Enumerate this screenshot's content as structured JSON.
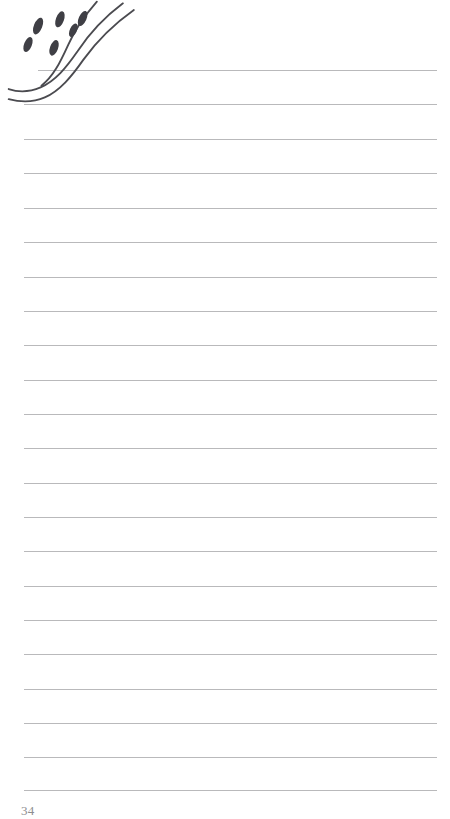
{
  "page": {
    "kind": "lined-notebook-page",
    "width": 450,
    "height": 819,
    "background_color": "#ffffff",
    "page_number": "34"
  },
  "rules": {
    "line_color": "#b9b9bb",
    "line_thickness_px": 1,
    "left_margin_px": 24,
    "right_edge_px": 437,
    "spacing_px": 34.5,
    "count": 22,
    "lines": [
      {
        "y": 70,
        "x1": 38,
        "x2": 437
      },
      {
        "y": 104,
        "x1": 24,
        "x2": 437
      },
      {
        "y": 139,
        "x1": 24,
        "x2": 437
      },
      {
        "y": 173,
        "x1": 24,
        "x2": 437
      },
      {
        "y": 208,
        "x1": 24,
        "x2": 437
      },
      {
        "y": 242,
        "x1": 24,
        "x2": 437
      },
      {
        "y": 277,
        "x1": 24,
        "x2": 437
      },
      {
        "y": 311,
        "x1": 24,
        "x2": 437
      },
      {
        "y": 345,
        "x1": 24,
        "x2": 437
      },
      {
        "y": 380,
        "x1": 24,
        "x2": 437
      },
      {
        "y": 414,
        "x1": 24,
        "x2": 437
      },
      {
        "y": 448,
        "x1": 24,
        "x2": 437
      },
      {
        "y": 483,
        "x1": 24,
        "x2": 437
      },
      {
        "y": 517,
        "x1": 24,
        "x2": 437
      },
      {
        "y": 551,
        "x1": 24,
        "x2": 437
      },
      {
        "y": 586,
        "x1": 24,
        "x2": 437
      },
      {
        "y": 620,
        "x1": 24,
        "x2": 437
      },
      {
        "y": 654,
        "x1": 24,
        "x2": 437
      },
      {
        "y": 689,
        "x1": 24,
        "x2": 437
      },
      {
        "y": 723,
        "x1": 24,
        "x2": 437
      },
      {
        "y": 757,
        "x1": 24,
        "x2": 437
      },
      {
        "y": 790,
        "x1": 24,
        "x2": 437
      }
    ]
  },
  "illustration": {
    "name": "flowing-leaf-sprig-doodle",
    "stroke_color": "#4b4b50",
    "fill_color": "#3f3f45",
    "stroke_width_px": 2.2,
    "description": "Hand drawn sprig of flowing curved stems with elongated oval leaves/seeds scattered above, occupying the top-left corner",
    "strokes": [
      "M 128 -14 C 104 4, 88 22, 74 42 C 60 62, 48 76, 30 84 C 16 90, 4 90, -6 86",
      "M 140 -6 C 116 10, 96 30, 80 52 C 66 72, 52 88, 34 96 C 20 102, 6 102, -6 98",
      "M 96 -16 C 82 0, 70 16, 62 34 C 52 56, 44 72, 30 82"
    ],
    "dots": [
      {
        "cx": 27,
        "cy": 11,
        "rx": 5.0,
        "ry": 10.5,
        "rot": 22
      },
      {
        "cx": 53,
        "cy": 3,
        "rx": 4.8,
        "ry": 10.0,
        "rot": 20
      },
      {
        "cx": 80,
        "cy": 2,
        "rx": 4.6,
        "ry": 9.6,
        "rot": 24
      },
      {
        "cx": 46,
        "cy": 37,
        "rx": 4.8,
        "ry": 9.8,
        "rot": 20
      },
      {
        "cx": 15,
        "cy": 33,
        "rx": 4.6,
        "ry": 9.4,
        "rot": 22
      },
      {
        "cx": 69,
        "cy": 16,
        "rx": 4.2,
        "ry": 8.6,
        "rot": 25
      }
    ]
  }
}
